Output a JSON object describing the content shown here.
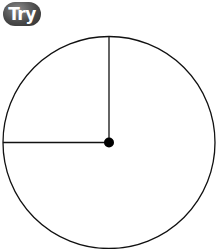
{
  "badge": {
    "label": "Try"
  },
  "diagram": {
    "type": "clock-face-angle",
    "circle": {
      "cx": 109,
      "cy": 142.5,
      "r": 106
    },
    "center_dot": {
      "r": 5
    },
    "rays": [
      {
        "name": "vertical-up",
        "x2": 109,
        "y2": 36.5
      },
      {
        "name": "horizontal-left",
        "x2": 3,
        "y2": 142.5
      }
    ],
    "stroke_color": "#111111"
  }
}
